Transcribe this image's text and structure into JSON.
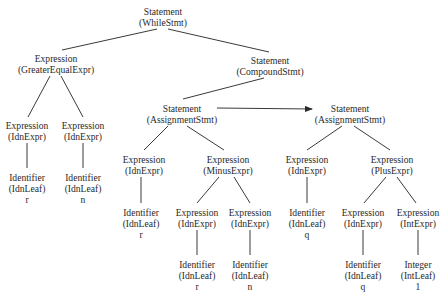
{
  "diagram": {
    "type": "abstract-syntax-tree",
    "nodes": [
      {
        "id": "n0",
        "category": "Statement",
        "kind": "(WhileStmt)",
        "value": "",
        "x": 163,
        "y": 6
      },
      {
        "id": "n1",
        "category": "Expression",
        "kind": "(GreaterEqualExpr)",
        "value": "",
        "x": 56,
        "y": 53
      },
      {
        "id": "n2",
        "category": "Statement",
        "kind": "(CompoundStmt)",
        "value": "",
        "x": 270,
        "y": 55
      },
      {
        "id": "n3",
        "category": "Expression",
        "kind": "(IdnExpr)",
        "value": "",
        "x": 27,
        "y": 120
      },
      {
        "id": "n4",
        "category": "Expression",
        "kind": "(IdnExpr)",
        "value": "",
        "x": 83,
        "y": 120
      },
      {
        "id": "n5",
        "category": "Identifier",
        "kind": "(IdnLeaf)",
        "value": "r",
        "x": 27,
        "y": 172
      },
      {
        "id": "n6",
        "category": "Identifier",
        "kind": "(IdnLeaf)",
        "value": "n",
        "x": 83,
        "y": 172
      },
      {
        "id": "n7",
        "category": "Statement",
        "kind": "(AssignmentStmt)",
        "value": "",
        "x": 182,
        "y": 103
      },
      {
        "id": "n8",
        "category": "Statement",
        "kind": "(AssignmentStmt)",
        "value": "",
        "x": 350,
        "y": 103
      },
      {
        "id": "n9",
        "category": "Expression",
        "kind": "(IdnExpr)",
        "value": "",
        "x": 144,
        "y": 154
      },
      {
        "id": "n10",
        "category": "Expression",
        "kind": "(MinusExpr)",
        "value": "",
        "x": 228,
        "y": 154
      },
      {
        "id": "n11",
        "category": "Identifier",
        "kind": "(IdnLeaf)",
        "value": "r",
        "x": 141,
        "y": 207
      },
      {
        "id": "n12",
        "category": "Expression",
        "kind": "(IdnExpr)",
        "value": "",
        "x": 197,
        "y": 207
      },
      {
        "id": "n13",
        "category": "Expression",
        "kind": "(IdnExpr)",
        "value": "",
        "x": 250,
        "y": 207
      },
      {
        "id": "n14",
        "category": "Identifier",
        "kind": "(IdnLeaf)",
        "value": "r",
        "x": 197,
        "y": 259
      },
      {
        "id": "n15",
        "category": "Identifier",
        "kind": "(IdnLeaf)",
        "value": "n",
        "x": 250,
        "y": 259
      },
      {
        "id": "n16",
        "category": "Expression",
        "kind": "(IdnExpr)",
        "value": "",
        "x": 307,
        "y": 154
      },
      {
        "id": "n17",
        "category": "Expression",
        "kind": "(PlusExpr)",
        "value": "",
        "x": 392,
        "y": 154
      },
      {
        "id": "n18",
        "category": "Identifier",
        "kind": "(IdnLeaf)",
        "value": "q",
        "x": 307,
        "y": 207
      },
      {
        "id": "n19",
        "category": "Expression",
        "kind": "(IdnExpr)",
        "value": "",
        "x": 363,
        "y": 207
      },
      {
        "id": "n20",
        "category": "Expression",
        "kind": "(IntExpr)",
        "value": "",
        "x": 418,
        "y": 207
      },
      {
        "id": "n21",
        "category": "Identifier",
        "kind": "(IdnLeaf)",
        "value": "q",
        "x": 363,
        "y": 259
      },
      {
        "id": "n22",
        "category": "Integer",
        "kind": "(IntLeaf)",
        "value": "1",
        "x": 418,
        "y": 259
      }
    ],
    "edges": [
      {
        "x1": 157,
        "y1": 29,
        "x2": 62,
        "y2": 50
      },
      {
        "x1": 168,
        "y1": 29,
        "x2": 269,
        "y2": 52
      },
      {
        "x1": 50,
        "y1": 76,
        "x2": 28,
        "y2": 117
      },
      {
        "x1": 61,
        "y1": 76,
        "x2": 83,
        "y2": 117
      },
      {
        "x1": 27,
        "y1": 143,
        "x2": 27,
        "y2": 168
      },
      {
        "x1": 83,
        "y1": 143,
        "x2": 83,
        "y2": 168
      },
      {
        "x1": 264,
        "y1": 78,
        "x2": 183,
        "y2": 99
      },
      {
        "x1": 168,
        "y1": 126,
        "x2": 144,
        "y2": 150
      },
      {
        "x1": 187,
        "y1": 126,
        "x2": 224,
        "y2": 150
      },
      {
        "x1": 141,
        "y1": 177,
        "x2": 141,
        "y2": 203
      },
      {
        "x1": 219,
        "y1": 177,
        "x2": 197,
        "y2": 203
      },
      {
        "x1": 234,
        "y1": 177,
        "x2": 250,
        "y2": 203
      },
      {
        "x1": 197,
        "y1": 230,
        "x2": 197,
        "y2": 255
      },
      {
        "x1": 250,
        "y1": 230,
        "x2": 250,
        "y2": 255
      },
      {
        "x1": 342,
        "y1": 126,
        "x2": 307,
        "y2": 150
      },
      {
        "x1": 354,
        "y1": 126,
        "x2": 390,
        "y2": 150
      },
      {
        "x1": 307,
        "y1": 177,
        "x2": 307,
        "y2": 203
      },
      {
        "x1": 386,
        "y1": 177,
        "x2": 364,
        "y2": 203
      },
      {
        "x1": 397,
        "y1": 177,
        "x2": 416,
        "y2": 203
      },
      {
        "x1": 363,
        "y1": 230,
        "x2": 363,
        "y2": 255
      },
      {
        "x1": 418,
        "y1": 230,
        "x2": 418,
        "y2": 255
      }
    ],
    "arrows": [
      {
        "x1": 217,
        "y1": 108,
        "x2": 312,
        "y2": 109
      }
    ],
    "colors": {
      "line": "#3a3a3a",
      "text": "#2a2a2a",
      "background": "#ffffff"
    }
  }
}
